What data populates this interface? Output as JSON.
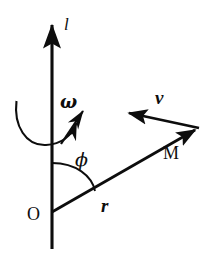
{
  "figure": {
    "background_color": "#ffffff",
    "stroke_color": "#0d0d0d",
    "width": 217,
    "height": 257,
    "labels": {
      "axis": "l",
      "angular_velocity": "ω",
      "velocity": "v",
      "angle": "ϕ",
      "radius": "r",
      "point": "M",
      "origin": "O"
    },
    "elements": [
      {
        "name": "rotation-axis",
        "kind": "arrow",
        "label": "l",
        "from": [
          52,
          248
        ],
        "to": [
          52,
          13
        ]
      },
      {
        "name": "angular-velocity-vector",
        "kind": "arrow",
        "label": "ω",
        "from": [
          62,
          143
        ],
        "to": [
          86,
          107
        ]
      },
      {
        "name": "rotation-curved-arrow",
        "kind": "curved-arrow",
        "label": "",
        "from": [
          16,
          102
        ],
        "to": [
          79,
          117
        ]
      },
      {
        "name": "radius-vector",
        "kind": "arrow",
        "label": "r",
        "from": [
          52,
          212
        ],
        "to": [
          201,
          127
        ]
      },
      {
        "name": "velocity-vector",
        "kind": "arrow",
        "label": "v",
        "from": [
          199,
          128
        ],
        "to": [
          122,
          112
        ]
      },
      {
        "name": "angle-arc",
        "kind": "arc",
        "label": "ϕ",
        "center": [
          52,
          212
        ],
        "radius": 49
      },
      {
        "name": "point-m",
        "kind": "point-label",
        "label": "M",
        "at": [
          196,
          152
        ]
      },
      {
        "name": "origin-o",
        "kind": "point-label",
        "label": "O",
        "at": [
          33,
          213
        ]
      }
    ]
  }
}
